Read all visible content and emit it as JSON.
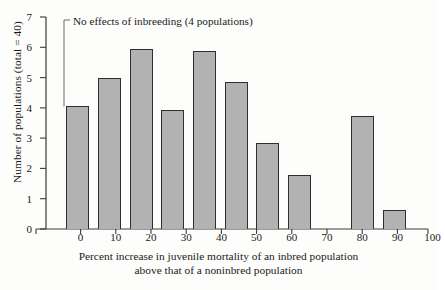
{
  "chart_data": {
    "type": "bar",
    "title": "",
    "xlabel": "Percent increase in juvenile mortality of an inbred population above that of a noninbred population",
    "xlabel_line1": "Percent increase in juvenile mortality of an inbred population",
    "xlabel_line2": "above that of a noninbred population",
    "ylabel": "Number of populations (total = 40)",
    "categories": [
      "0",
      "10",
      "20",
      "30",
      "40",
      "50",
      "60",
      "70",
      "80",
      "90",
      "100"
    ],
    "values": [
      4.05,
      5.0,
      5.95,
      3.93,
      5.88,
      4.85,
      2.83,
      1.77,
      0,
      3.73,
      0.62
    ],
    "xlim": [
      -10,
      110
    ],
    "ylim": [
      0,
      7
    ],
    "yticks": [
      "0",
      "1",
      "2",
      "3",
      "4",
      "5",
      "6",
      "7"
    ],
    "xticks": [
      "0",
      "10",
      "20",
      "30",
      "40",
      "50",
      "60",
      "70",
      "80",
      "90",
      "100"
    ],
    "grid": false,
    "legend": "none",
    "annotations": [
      {
        "text": "No effects of inbreeding (4 populations)",
        "points_to_category": "0",
        "points_to_value": 4.05
      }
    ],
    "bar_fill_color": "#b2b2b2",
    "bar_edge_color": "#2f2f2f",
    "axis_color": "#3a3a3a",
    "background_color": "#fdfdfb"
  }
}
